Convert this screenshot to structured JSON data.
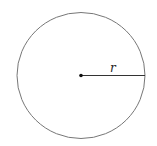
{
  "diagram": {
    "type": "circle",
    "center": {
      "x": 81,
      "y": 75
    },
    "radius": 64,
    "radius_label": "r",
    "stroke_color": "#777777",
    "line_color": "#333333",
    "dot_color": "#111111"
  }
}
